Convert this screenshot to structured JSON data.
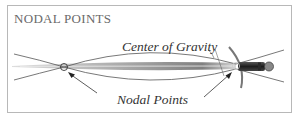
{
  "title": "NODAL POINTS",
  "labels": {
    "center_of_gravity": "Center of Gravity",
    "nodal_points": "Nodal Points"
  },
  "colors": {
    "title": "#6a6a6a",
    "text": "#333333",
    "line": "#555555",
    "border": "#b8b8b8"
  }
}
